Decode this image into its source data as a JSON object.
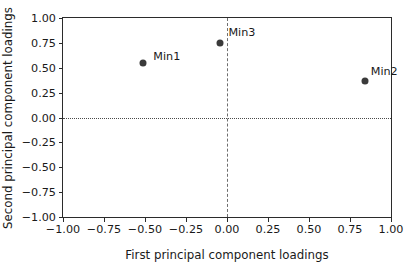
{
  "chart_data": {
    "type": "scatter",
    "title": "",
    "xlabel": "First principal component loadings",
    "ylabel": "Second principal component loadings",
    "xlim": [
      -1.0,
      1.0
    ],
    "ylim": [
      -1.0,
      1.0
    ],
    "grid": false,
    "legend": "none",
    "xticks": [
      -1.0,
      -0.75,
      -0.5,
      -0.25,
      0.0,
      0.25,
      0.5,
      0.75,
      1.0
    ],
    "yticks": [
      -1.0,
      -0.75,
      -0.5,
      -0.25,
      0.0,
      0.25,
      0.5,
      0.75,
      1.0
    ],
    "xtick_labels": [
      "−1.00",
      "−0.75",
      "−0.50",
      "−0.25",
      "0.00",
      "0.25",
      "0.50",
      "0.75",
      "1.00"
    ],
    "ytick_labels": [
      "−1.00",
      "−0.75",
      "−0.50",
      "−0.25",
      "0.00",
      "0.25",
      "0.50",
      "0.75",
      "1.00"
    ],
    "reference_lines": [
      {
        "axis": "horizontal",
        "value": 0.0,
        "style": "dotted"
      },
      {
        "axis": "vertical",
        "value": 0.0,
        "style": "dashed"
      }
    ],
    "marker_color": "#3a3a3a",
    "points": [
      {
        "label": "Min1",
        "x": -0.51,
        "y": 0.55,
        "label_dx": 10,
        "label_dy": -13
      },
      {
        "label": "Min3",
        "x": -0.04,
        "y": 0.75,
        "label_dx": 8,
        "label_dy": -17
      },
      {
        "label": "Min2",
        "x": 0.84,
        "y": 0.37,
        "label_dx": 6,
        "label_dy": -16
      }
    ]
  }
}
